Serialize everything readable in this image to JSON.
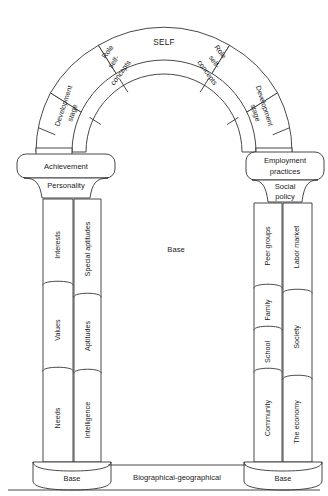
{
  "diagram": {
    "keystone": {
      "label": "SELF"
    },
    "arch_segments": [
      {
        "id": "dev-stage-left",
        "label": "Development stage",
        "side": "left"
      },
      {
        "id": "role-self-left",
        "label": "Role self-concepts",
        "side": "left"
      },
      {
        "id": "keystone-self",
        "label": "SELF",
        "side": "center"
      },
      {
        "id": "role-self-right",
        "label": "Role self-concepts",
        "side": "right"
      },
      {
        "id": "dev-stage-right",
        "label": "Development stage",
        "side": "right"
      }
    ],
    "left_column": {
      "capital_label": "Achievement",
      "abacus_label": "Personality",
      "inner_segments": [
        "Interests",
        "Values",
        "Needs"
      ],
      "outer_segments": [
        "Special aptitudes",
        "Aptitudes",
        "Intelligence"
      ],
      "base_label": "Base"
    },
    "right_column": {
      "capital_label": "Employment practices",
      "capital_label_line1": "Employment",
      "capital_label_line2": "practices",
      "abacus_label": "Social policy",
      "abacus_label_line1": "Social",
      "abacus_label_line2": "policy",
      "inner_segments": [
        "Peer groups",
        "Family",
        "School",
        "Community"
      ],
      "outer_segments": [
        "Labor market",
        "Society",
        "The economy"
      ],
      "base_label": "Base"
    },
    "center_label": "Base",
    "foundation_label": "Biographical-geographical",
    "colors": {
      "stroke": "#333333",
      "fill": "#ffffff",
      "text": "#1a1a1a",
      "background": "#ffffff"
    }
  }
}
